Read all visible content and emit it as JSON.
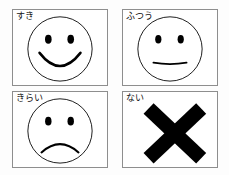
{
  "canvas": {
    "width": 229,
    "height": 175,
    "background_color": "#fdfdfd",
    "panel_background_color": "#ffffff",
    "panel_border_color": "#8e8e8e",
    "ink_color": "#000000"
  },
  "title": "",
  "panels": [
    {
      "key": "suki",
      "label": "すき",
      "label_romaji": "suki",
      "icon": "smiley-happy-face-icon",
      "expression": "happy",
      "description": "Outlined circular face with two oval eyes and a wide upturned smiling mouth"
    },
    {
      "key": "futsuu",
      "label": "ふつう",
      "label_romaji": "futsuu",
      "icon": "smiley-neutral-face-icon",
      "expression": "neutral",
      "description": "Outlined circular face with two oval eyes and a flat horizontal mouth"
    },
    {
      "key": "kirai",
      "label": "きらい",
      "label_romaji": "kirai",
      "icon": "smiley-sad-face-icon",
      "expression": "sad",
      "description": "Outlined circular face with two oval eyes and a downturned frowning mouth"
    },
    {
      "key": "nai",
      "label": "ない",
      "label_romaji": "nai",
      "icon": "cross-x-mark-icon",
      "expression": "none",
      "description": "Solid black bold X / cross mark"
    }
  ]
}
